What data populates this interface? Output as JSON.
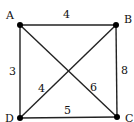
{
  "graph": {
    "nodes": [
      {
        "id": "A",
        "label": "A",
        "x": 20,
        "y": 25,
        "lx": 6,
        "ly": 19
      },
      {
        "id": "B",
        "label": "B",
        "x": 116,
        "y": 25,
        "lx": 124,
        "ly": 23
      },
      {
        "id": "C",
        "label": "C",
        "x": 117,
        "y": 117,
        "lx": 125,
        "ly": 122
      },
      {
        "id": "D",
        "label": "D",
        "x": 20,
        "y": 118,
        "lx": 5,
        "ly": 122
      }
    ],
    "edges": [
      {
        "from": "A",
        "to": "B",
        "weight": "4",
        "lx": 63,
        "ly": 18
      },
      {
        "from": "A",
        "to": "D",
        "weight": "3",
        "lx": 9,
        "ly": 75
      },
      {
        "from": "B",
        "to": "C",
        "weight": "8",
        "lx": 121,
        "ly": 74
      },
      {
        "from": "D",
        "to": "B",
        "weight": "4",
        "lx": 38,
        "ly": 92
      },
      {
        "from": "A",
        "to": "C",
        "weight": "6",
        "lx": 90,
        "ly": 91
      },
      {
        "from": "D",
        "to": "C",
        "weight": "5",
        "lx": 64,
        "ly": 114
      }
    ]
  }
}
